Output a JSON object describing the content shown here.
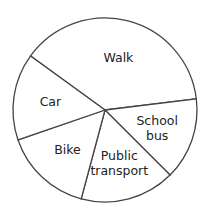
{
  "chart_data": {
    "type": "pie",
    "title": "",
    "categories": [
      "Walk",
      "School bus",
      "Public transport",
      "Bike",
      "Car"
    ],
    "values_degrees": [
      137,
      52,
      60,
      56,
      55
    ],
    "values_percent": [
      38.1,
      14.4,
      16.7,
      15.6,
      15.3
    ],
    "start_angle_deg": 216,
    "direction": "clockwise",
    "slices": [
      {
        "label": "Walk",
        "lines": [
          "Walk"
        ],
        "degrees": 137,
        "fill": "#ffffff"
      },
      {
        "label": "School bus",
        "lines": [
          "School",
          "bus"
        ],
        "degrees": 52,
        "fill": "#ffffff"
      },
      {
        "label": "Public transport",
        "lines": [
          "Public",
          "transport"
        ],
        "degrees": 60,
        "fill": "#ffffff"
      },
      {
        "label": "Bike",
        "lines": [
          "Bike"
        ],
        "degrees": 56,
        "fill": "#ffffff"
      },
      {
        "label": "Car",
        "lines": [
          "Car"
        ],
        "degrees": 55,
        "fill": "#ffffff"
      }
    ],
    "legend": "none (labels inside slices)",
    "colors": {
      "stroke": "#444444",
      "fill": "#ffffff",
      "text": "#222222"
    }
  },
  "geometry": {
    "cx": 105,
    "cy": 110,
    "r": 92
  }
}
